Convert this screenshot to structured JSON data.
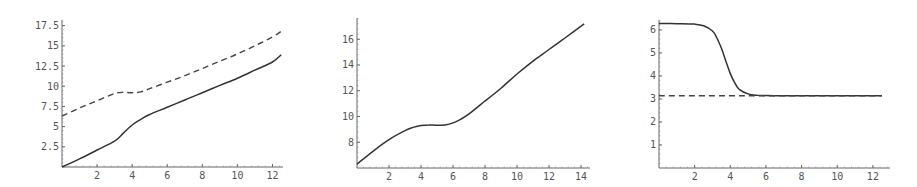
{
  "chart_data": [
    {
      "type": "line",
      "title": "",
      "xlabel": "",
      "ylabel": "",
      "xlim": [
        0,
        12.6
      ],
      "ylim": [
        0,
        17.6
      ],
      "grid": false,
      "x_ticks": [
        2,
        4,
        6,
        8,
        10,
        12
      ],
      "y_ticks": [
        2.5,
        5,
        7.5,
        10,
        12.5,
        15,
        17.5
      ],
      "x_tick_labels": [
        "2",
        "4",
        "6",
        "8",
        "10",
        "12"
      ],
      "y_tick_labels": [
        "2.5",
        "5",
        "7.5",
        "10",
        "12.5",
        "15",
        "17.5"
      ],
      "frame": {
        "x0": 62,
        "y0": 167,
        "x1": 283,
        "y1": 20,
        "xmin": 0,
        "xmax": 12.6,
        "ymin": 0,
        "ymax": 18.2
      },
      "series": [
        {
          "name": "dashed",
          "style": "dashed",
          "x": [
            0,
            1,
            2,
            3,
            3.5,
            4,
            4.5,
            5,
            6,
            7,
            8,
            9,
            10,
            11,
            12,
            12.5
          ],
          "values": [
            6.3,
            7.3,
            8.2,
            9.1,
            9.25,
            9.2,
            9.3,
            9.7,
            10.5,
            11.3,
            12.2,
            13.1,
            14.0,
            15.0,
            16.1,
            16.8
          ]
        },
        {
          "name": "solid",
          "style": "solid",
          "x": [
            0,
            1,
            2,
            3,
            3.5,
            4,
            4.5,
            5,
            6,
            7,
            8,
            9,
            10,
            11,
            12,
            12.5
          ],
          "values": [
            0,
            1.0,
            2.1,
            3.2,
            4.2,
            5.2,
            5.9,
            6.5,
            7.4,
            8.3,
            9.2,
            10.1,
            11.0,
            12.0,
            13.0,
            13.9
          ]
        }
      ]
    },
    {
      "type": "line",
      "title": "",
      "xlabel": "",
      "ylabel": "",
      "xlim": [
        0,
        14.3
      ],
      "ylim": [
        6,
        17.6
      ],
      "grid": false,
      "x_ticks": [
        2,
        4,
        6,
        8,
        10,
        12,
        14
      ],
      "y_ticks": [
        8,
        10,
        12,
        14,
        16
      ],
      "x_tick_labels": [
        "2",
        "4",
        "6",
        "8",
        "10",
        "12",
        "14"
      ],
      "y_tick_labels": [
        "8",
        "10",
        "12",
        "14",
        "16"
      ],
      "frame": {
        "x0": 357,
        "y0": 168,
        "x1": 590,
        "y1": 18,
        "xmin": 0,
        "xmax": 14.56,
        "ymin": 6,
        "ymax": 17.65
      },
      "series": [
        {
          "name": "solid",
          "style": "solid",
          "x": [
            0,
            1,
            2,
            3,
            3.5,
            4,
            4.5,
            5,
            5.5,
            6,
            6.5,
            7,
            8,
            9,
            10,
            11,
            12,
            13,
            14.2
          ],
          "values": [
            6.3,
            7.3,
            8.2,
            8.9,
            9.15,
            9.3,
            9.35,
            9.32,
            9.35,
            9.5,
            9.8,
            10.2,
            11.2,
            12.2,
            13.3,
            14.3,
            15.2,
            16.1,
            17.2
          ]
        }
      ]
    },
    {
      "type": "line",
      "title": "",
      "xlabel": "",
      "ylabel": "",
      "xlim": [
        0,
        12.6
      ],
      "ylim": [
        0,
        6.4
      ],
      "grid": false,
      "x_ticks": [
        2,
        4,
        6,
        8,
        10,
        12
      ],
      "y_ticks": [
        1,
        2,
        3,
        4,
        5,
        6
      ],
      "x_tick_labels": [
        "2",
        "4",
        "6",
        "8",
        "10",
        "12"
      ],
      "y_tick_labels": [
        "1",
        "2",
        "3",
        "4",
        "5",
        "6"
      ],
      "frame": {
        "x0": 659,
        "y0": 168,
        "x1": 890,
        "y1": 20,
        "xmin": 0,
        "xmax": 12.96,
        "ymin": 0,
        "ymax": 6.43
      },
      "series": [
        {
          "name": "solid",
          "style": "solid",
          "x": [
            0,
            1,
            2,
            2.5,
            3,
            3.25,
            3.5,
            3.75,
            4,
            4.25,
            4.5,
            5,
            5.5,
            6,
            7,
            8,
            10,
            12.5
          ],
          "values": [
            6.28,
            6.27,
            6.25,
            6.18,
            5.95,
            5.65,
            5.2,
            4.65,
            4.1,
            3.7,
            3.42,
            3.22,
            3.16,
            3.15,
            3.14,
            3.14,
            3.14,
            3.14
          ]
        },
        {
          "name": "dashed",
          "style": "dashed",
          "x": [
            0,
            12.5
          ],
          "values": [
            3.14,
            3.14
          ]
        }
      ]
    }
  ]
}
